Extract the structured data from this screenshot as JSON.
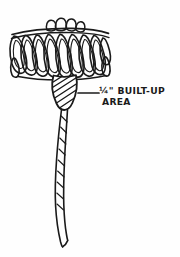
{
  "figure": {
    "medium": "ink line drawing",
    "background_color": "#fefefe",
    "ink_color": "#1a1a1a",
    "parts": [
      {
        "name": "loop-cluster-head",
        "description": "cluster of teardrop shaped thread loops forming the brush head",
        "loop_count": 11,
        "crown_bulb_count": 4
      },
      {
        "name": "built-up-cone-body",
        "description": "cross hatched conical thread build-up below the loop head",
        "hatch_line_count": 9
      },
      {
        "name": "tapering-tail",
        "description": "long curving tapered tail with internal twist pattern",
        "segment_count": 9
      }
    ]
  },
  "callout": {
    "leader_line": {
      "name": "leader-line",
      "from_x": 78,
      "to_x": 99,
      "y": 93
    },
    "line_1_fraction": "¼\"",
    "line_1_rest": " BUILT-UP",
    "line_1_full": "¼\" BUILT-UP",
    "line_2": "AREA",
    "full_text": "¼\" BUILT-UP AREA"
  },
  "canvas": {
    "width": 180,
    "height": 257
  }
}
